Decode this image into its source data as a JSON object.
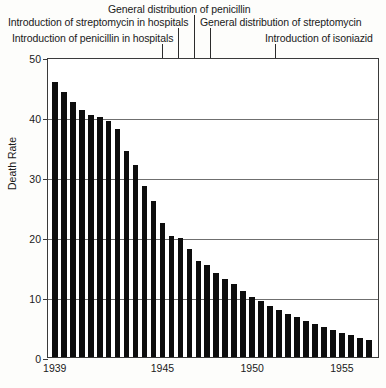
{
  "chart_data": {
    "type": "bar",
    "title": "",
    "xlabel": "",
    "ylabel": "Death Rate",
    "ylim": [
      0,
      50
    ],
    "yticks": [
      0,
      10,
      20,
      30,
      40,
      50
    ],
    "ytick_labels": [
      "0",
      "10",
      "20",
      "30",
      "40",
      "50"
    ],
    "grid": true,
    "legend": false,
    "xtick_years": [
      1939,
      1945,
      1950,
      1955
    ],
    "xtick_labels": [
      "1939",
      "1945",
      "1950",
      "1955"
    ],
    "x": [
      1939.0,
      1939.5,
      1940.0,
      1940.5,
      1941.0,
      1941.5,
      1942.0,
      1942.5,
      1943.0,
      1943.5,
      1944.0,
      1944.5,
      1945.0,
      1945.5,
      1946.0,
      1946.5,
      1947.0,
      1947.5,
      1948.0,
      1948.5,
      1949.0,
      1949.5,
      1950.0,
      1950.5,
      1951.0,
      1951.5,
      1952.0,
      1952.5,
      1953.0,
      1953.5,
      1954.0,
      1954.5,
      1955.0,
      1955.5,
      1956.0,
      1956.5
    ],
    "values": [
      45.8,
      44.2,
      42.5,
      41.2,
      40.3,
      40.0,
      39.3,
      38.0,
      34.3,
      32.0,
      28.5,
      26.0,
      22.3,
      20.2,
      19.8,
      18.0,
      16.0,
      15.3,
      14.0,
      13.0,
      12.2,
      11.0,
      10.0,
      9.3,
      8.5,
      7.8,
      7.2,
      6.6,
      6.0,
      5.5,
      5.0,
      4.5,
      4.0,
      3.6,
      3.2,
      2.9
    ],
    "annotations": [
      {
        "text": "General distribution of penicillin",
        "year": 1946.0
      },
      {
        "text": "Introduction of streptomycin in hospitals",
        "year": 1945.0
      },
      {
        "text": "Introduction of penicillin in hospitals",
        "year": 1944.0
      },
      {
        "text": "General distribution of streptomycin",
        "year": 1947.0
      },
      {
        "text": "Introduction of isoniazid",
        "year": 1952.0
      }
    ]
  },
  "annotation_labels": {
    "general_penicillin": "General distribution of penicillin",
    "streptomycin_hospitals": "Introduction of streptomycin in hospitals",
    "penicillin_hospitals": "Introduction of penicillin in hospitals",
    "general_streptomycin": "General distribution of streptomycin",
    "isoniazid": "Introduction of isoniazid"
  },
  "axis": {
    "y_title": "Death Rate",
    "y_0": "0",
    "y_10": "10",
    "y_20": "20",
    "y_30": "30",
    "y_40": "40",
    "y_50": "50",
    "x_1939": "1939",
    "x_1945": "1945",
    "x_1950": "1950",
    "x_1955": "1955"
  },
  "colors": {
    "bar": "#0d0d0d",
    "grid": "#6f6f6f",
    "axis": "#3a3a3a",
    "background": "#ffffff",
    "text": "#1a1a1a"
  }
}
